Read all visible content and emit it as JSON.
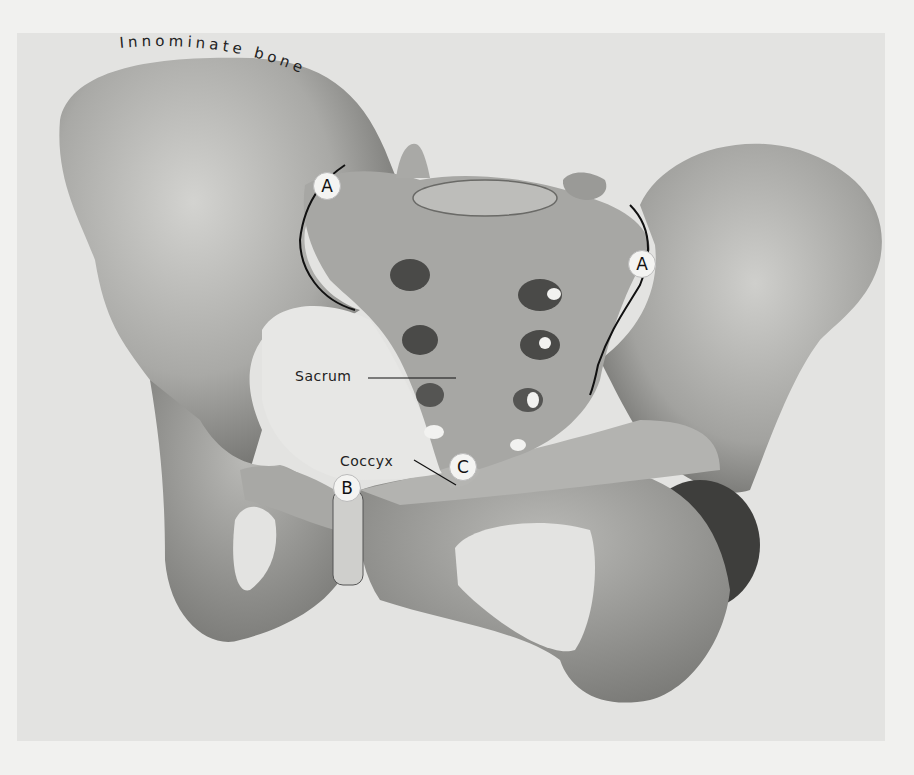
{
  "figure": {
    "labels": {
      "innominate": "Innominate bone",
      "sacrum": "Sacrum",
      "coccyx": "Coccyx"
    },
    "markers": [
      {
        "id": "A-left",
        "text": "A"
      },
      {
        "id": "A-right",
        "text": "A"
      },
      {
        "id": "B",
        "text": "B"
      },
      {
        "id": "C",
        "text": "C"
      }
    ],
    "colors": {
      "background": "#f1f1ef",
      "panel": "#e3e3e1",
      "bone_light": "#c9c9c6",
      "bone_mid": "#9f9f9c",
      "bone_dark": "#555553",
      "label": "#222222"
    }
  }
}
